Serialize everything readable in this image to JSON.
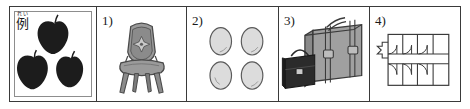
{
  "sheet": {
    "type": "worksheet-picture-strip",
    "panel_count": 5,
    "border_color": "#3a3a3a",
    "background": "#ffffff"
  },
  "panels": [
    {
      "id": "example",
      "label": "例",
      "furigana": "れい",
      "label_kind": "kanji-example-marker",
      "content": "three apples",
      "item_count": 3,
      "colors": {
        "fill": "#1c1c1c",
        "stem": "#1c1c1c"
      }
    },
    {
      "id": "item-1",
      "label": "1）",
      "label_plain": "1)",
      "content": "ornate upholstered chair",
      "item_count": 1,
      "colors": {
        "fill": "#9a9a9a",
        "outline": "#4a4a4a",
        "shade": "#7d7d7d"
      }
    },
    {
      "id": "item-2",
      "label": "2）",
      "label_plain": "2)",
      "content": "four eggs",
      "item_count": 4,
      "colors": {
        "fill": "#dcdcdc",
        "outline": "#5a5a5a"
      }
    },
    {
      "id": "item-3",
      "label": "3）",
      "label_plain": "3)",
      "content": "suitcase and handbag",
      "item_count": 2,
      "colors": {
        "suitcase": "#a0a0a0",
        "handbag": "#2b2b2b",
        "outline": "#3a3a3a"
      }
    },
    {
      "id": "item-4",
      "label": "4）",
      "label_plain": "4)",
      "content": "building floor plan with rooms and doors",
      "item_count": 1,
      "colors": {
        "fill": "#ffffff",
        "outline": "#3a3a3a"
      }
    }
  ]
}
